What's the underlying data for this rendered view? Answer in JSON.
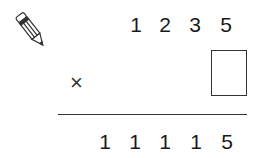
{
  "problem": {
    "type": "multiplication",
    "multiplicand_digits": [
      "1",
      "2",
      "3",
      "5"
    ],
    "operator": "×",
    "multiplier_placeholder": "",
    "product_digits": [
      "1",
      "1",
      "1",
      "1",
      "5"
    ]
  },
  "icons": {
    "pencil": "pencil-icon"
  }
}
